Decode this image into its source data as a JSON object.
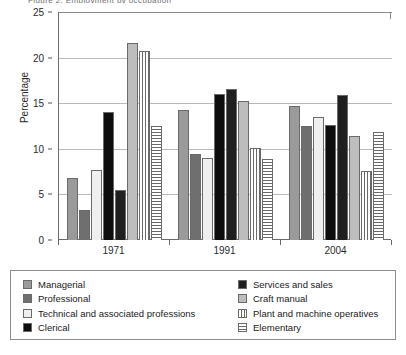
{
  "top_crop_text": "Figure 2: Employment by occupation",
  "chart_data": {
    "type": "bar",
    "title": "",
    "subtitle": "",
    "xlabel": "",
    "ylabel": "Percentage",
    "categories": [
      "1971",
      "1991",
      "2004"
    ],
    "ylim": [
      0,
      25
    ],
    "yticks": [
      0,
      5,
      10,
      15,
      20,
      25
    ],
    "grid": true,
    "legend_position": "bottom",
    "series": [
      {
        "name": "Managerial",
        "fill": "solid-medium-gray",
        "color": "#9a9a9a",
        "values": [
          6.8,
          14.3,
          14.7
        ]
      },
      {
        "name": "Professional",
        "fill": "solid-dark-gray",
        "color": "#6f6f6f",
        "values": [
          3.3,
          9.4,
          12.5
        ]
      },
      {
        "name": "Technical and associated professions",
        "fill": "solid-near-white",
        "color": "#efefef",
        "values": [
          7.7,
          9.0,
          13.5
        ]
      },
      {
        "name": "Clerical",
        "fill": "solid-black",
        "color": "#0d0d0d",
        "values": [
          14.0,
          16.0,
          12.6
        ]
      },
      {
        "name": "Services and sales",
        "fill": "solid-very-dark",
        "color": "#1f1f1f",
        "values": [
          5.5,
          16.6,
          15.9
        ]
      },
      {
        "name": "Craft manual",
        "fill": "solid-light-gray",
        "color": "#bdbdbd",
        "values": [
          21.6,
          15.2,
          11.4
        ]
      },
      {
        "name": "Plant and machine operatives",
        "fill": "vertical-stripes",
        "color": "#6a6a6a",
        "values": [
          20.7,
          10.1,
          7.6
        ]
      },
      {
        "name": "Elementary",
        "fill": "horizontal-stripes",
        "color": "#6a6a6a",
        "values": [
          12.5,
          8.9,
          11.8
        ]
      }
    ]
  },
  "axis": {
    "y_label": "Percentage",
    "y_tick_labels": [
      "25",
      "20",
      "15",
      "10",
      "5",
      "0"
    ],
    "x_tick_labels": [
      "1971",
      "1991",
      "2004"
    ]
  },
  "legend": {
    "left_column": [
      "Managerial",
      "Professional",
      "Technical and associated professions",
      "Clerical"
    ],
    "right_column": [
      "Services and sales",
      "Craft manual",
      "Plant and machine operatives",
      "Elementary"
    ]
  }
}
